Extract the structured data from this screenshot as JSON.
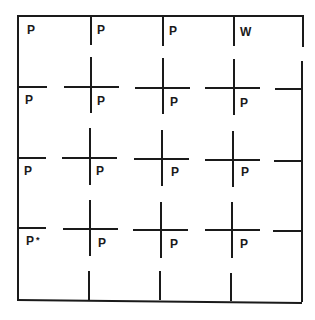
{
  "diagram": {
    "type": "grid",
    "rows": 4,
    "cols": 4,
    "line_color": "#1a1a1a",
    "cells": [
      [
        {
          "label": "P"
        },
        {
          "label": "P"
        },
        {
          "label": "P"
        },
        {
          "label": "W"
        }
      ],
      [
        {
          "label": "P"
        },
        {
          "label": "P"
        },
        {
          "label": "P"
        },
        {
          "label": "P"
        }
      ],
      [
        {
          "label": "P"
        },
        {
          "label": "P"
        },
        {
          "label": "P"
        },
        {
          "label": "P"
        }
      ],
      [
        {
          "label": "P",
          "mark": "*"
        },
        {
          "label": "P"
        },
        {
          "label": "P"
        },
        {
          "label": "P"
        }
      ]
    ]
  }
}
